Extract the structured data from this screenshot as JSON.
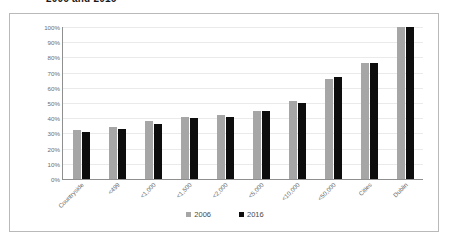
{
  "title": {
    "text": "2006 and 2016",
    "clipped": true
  },
  "legend": {
    "position": "bottom",
    "items": [
      {
        "label": "2006",
        "color": "#a6a6a6"
      },
      {
        "label": "2016",
        "color": "#0d0d0d"
      }
    ]
  },
  "colors": {
    "series_2006": "#a6a6a6",
    "series_2016": "#0d0d0d",
    "gridline": "#eaeaea",
    "axis": "#8f8f8f",
    "frame": "#b9b9b9",
    "tick_text": "#6d6d6d"
  },
  "chart_data": {
    "type": "bar",
    "title": "2006 and 2016",
    "xlabel": "",
    "ylabel": "",
    "ylim": [
      0,
      100
    ],
    "ytick_labels": [
      "100%",
      "90%",
      "80%",
      "70%",
      "60%",
      "50%",
      "40%",
      "30%",
      "20%",
      "10%",
      "0%"
    ],
    "ytick_values": [
      100,
      90,
      80,
      70,
      60,
      50,
      40,
      30,
      20,
      10,
      0
    ],
    "grid": true,
    "legend_position": "bottom",
    "categories": [
      "Countryside",
      "<499",
      "<1,000",
      "<1,500",
      "<2,000",
      "<5,000",
      "<10,000",
      "<50,000",
      "Cities",
      "Dublin"
    ],
    "series": [
      {
        "name": "2006",
        "color": "#a6a6a6",
        "values": [
          32,
          34,
          38,
          41,
          42,
          45,
          51,
          66,
          76,
          100
        ]
      },
      {
        "name": "2016",
        "color": "#0d0d0d",
        "values": [
          31,
          33,
          36,
          40,
          41,
          45,
          50,
          67,
          76,
          100
        ]
      }
    ]
  }
}
